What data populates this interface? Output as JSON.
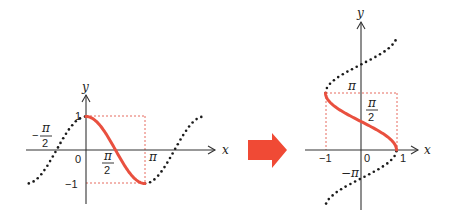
{
  "colors": {
    "curve": "#e9503f",
    "guide": "#e66a5e",
    "arrow": "#f04a35",
    "axis": "#333333",
    "dots": "#1a1a1a"
  },
  "left_graph": {
    "description": "y = cos x, with highlighted principal branch 0 ≤ x ≤ π",
    "x_axis_label": "x",
    "y_axis_label": "y",
    "tick_labels": {
      "origin": "0",
      "y_one": "1",
      "y_neg_one": "−1",
      "x_pi": "π",
      "x_half_pi_num": "π",
      "x_half_pi_den": "2",
      "x_neg_half_pi_sign": "−",
      "x_neg_half_pi_num": "π",
      "x_neg_half_pi_den": "2"
    }
  },
  "transform_arrow": {
    "icon": "right-arrow-icon"
  },
  "right_graph": {
    "description": "y = arccos x, inverse relation with highlighted branch −1 ≤ x ≤ 1, 0 ≤ y ≤ π",
    "x_axis_label": "x",
    "y_axis_label": "y",
    "tick_labels": {
      "origin": "0",
      "x_neg_one": "−1",
      "x_one": "1",
      "y_pi": "π",
      "y_half_pi_num": "π",
      "y_half_pi_den": "2",
      "y_neg_pi": "−π"
    }
  },
  "chart_data": [
    {
      "type": "line",
      "title": "y = cos x",
      "xlabel": "x",
      "ylabel": "y",
      "xlim": [
        -3.05,
        6.25
      ],
      "ylim": [
        -1.5,
        1.6
      ],
      "x_ticks": [
        "−π/2",
        "0",
        "π/2",
        "π"
      ],
      "y_ticks": [
        "1",
        "−1"
      ],
      "series": [
        {
          "name": "cos x (principal, solid red)",
          "x_range": [
            0,
            3.1416
          ],
          "style": "solid"
        },
        {
          "name": "cos x (extension left, dotted)",
          "x_range": [
            -3.05,
            0
          ],
          "style": "dotted"
        },
        {
          "name": "cos x (extension right, dotted)",
          "x_range": [
            3.1416,
            6.22
          ],
          "style": "dotted"
        }
      ],
      "guides": [
        "x = π",
        "y = 1",
        "y = −1"
      ]
    },
    {
      "type": "line",
      "title": "y = arccos x",
      "xlabel": "x",
      "ylabel": "y",
      "xlim": [
        -1.6,
        1.6
      ],
      "ylim": [
        -3.2,
        7.2
      ],
      "x_ticks": [
        "−1",
        "0",
        "1"
      ],
      "y_ticks": [
        "π",
        "π/2",
        "−π"
      ],
      "series": [
        {
          "name": "arccos x (principal, solid red)",
          "y_range": [
            0,
            3.1416
          ],
          "style": "solid"
        },
        {
          "name": "x = cos y (upper, dotted)",
          "y_range": [
            3.1416,
            6.28
          ],
          "style": "dotted"
        },
        {
          "name": "x = cos y (lower, dotted)",
          "y_range": [
            -2.95,
            0
          ],
          "style": "dotted"
        }
      ],
      "guides": [
        "x = −1",
        "x = 1",
        "y = π"
      ]
    }
  ]
}
